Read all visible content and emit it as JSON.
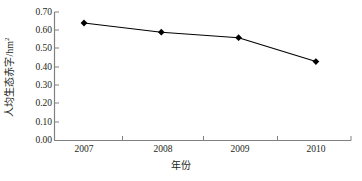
{
  "chart_data": {
    "type": "line",
    "title": "",
    "subtitle": "",
    "xlabel": "年份",
    "ylabel": "人均生态赤字/hm",
    "ylabel_superscript": "2",
    "categories": [
      "2007",
      "2008",
      "2009",
      "2010"
    ],
    "values": [
      0.64,
      0.59,
      0.56,
      0.43
    ],
    "series": [
      {
        "name": "人均生态赤字",
        "values": [
          0.64,
          0.59,
          0.56,
          0.43
        ],
        "marker": "diamond",
        "marker_color": "#000000",
        "line_color": "#000000"
      }
    ],
    "ylim": [
      0.0,
      0.7
    ],
    "ytick_step": 0.1,
    "yticks": [
      "0.70",
      "0.60",
      "0.50",
      "0.40",
      "0.30",
      "0.20",
      "0.10",
      "0.00"
    ],
    "xticks": [
      "2007",
      "2008",
      "2009",
      "2010"
    ],
    "grid": false,
    "legend": false,
    "legend_position": "none",
    "axis_color": "#808080",
    "background_color": "#ffffff",
    "text_color": "#231f20"
  }
}
